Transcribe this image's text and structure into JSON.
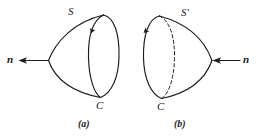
{
  "figure": {
    "background_color": "#ffffff",
    "ink_color": "#1c1c1c",
    "panels": [
      {
        "id": "a",
        "caption": "(a)",
        "surface_label": "S",
        "boundary_label": "C",
        "normal_label": "n",
        "normal_direction": "left",
        "boundary_arrow_direction": "clockwise-downward-on-near-arc",
        "hidden_arc_style": "solid",
        "apex_side": "left"
      },
      {
        "id": "b",
        "caption": "(b)",
        "surface_label": "S'",
        "boundary_label": "C",
        "normal_label": "n",
        "normal_direction": "left",
        "boundary_arrow_direction": "counterclockwise-downward-on-near-arc",
        "hidden_arc_style": "dashed",
        "apex_side": "right"
      }
    ]
  },
  "labels": {
    "panel_a": {
      "S": "S",
      "C": "C",
      "n": "n",
      "caption": "(a)"
    },
    "panel_b": {
      "S": "S",
      "S_prime": "′",
      "C": "C",
      "n": "n",
      "caption": "(b)"
    }
  }
}
